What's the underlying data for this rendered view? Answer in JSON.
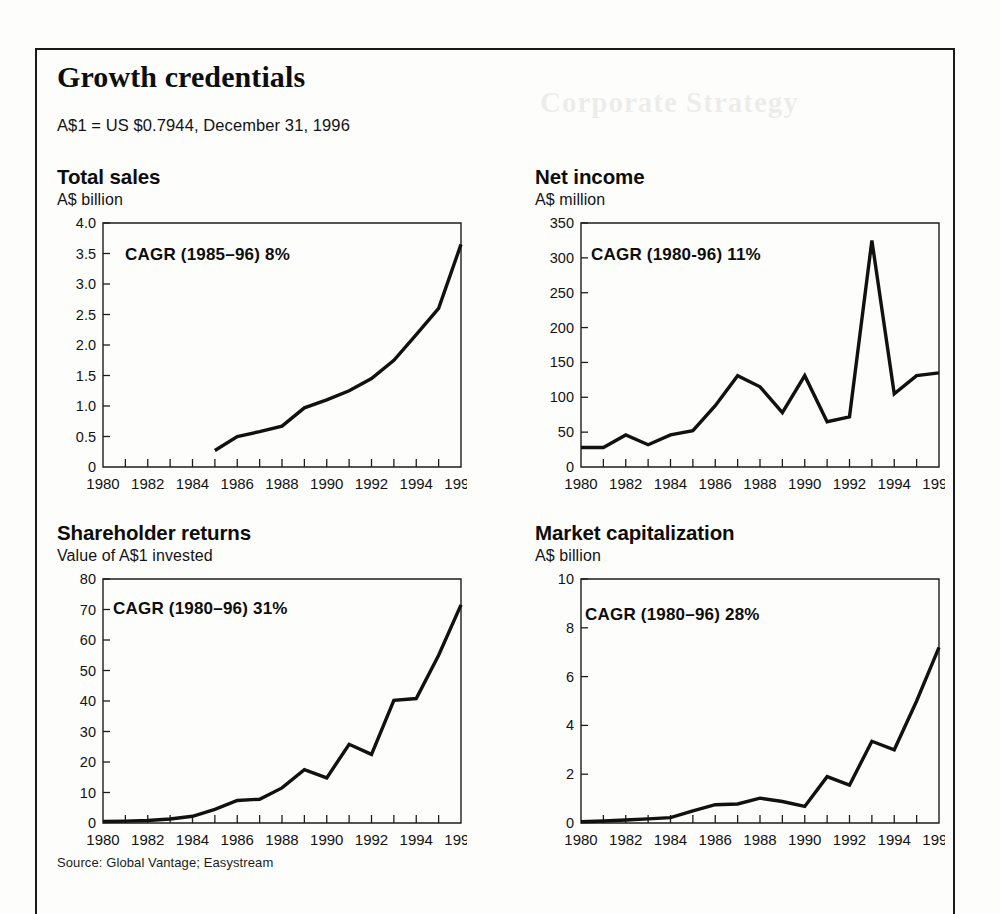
{
  "exhibit": {
    "title": "Growth credentials",
    "fx_note": "A$1 = US $0.7944, December 31, 1996",
    "source": "Source: Global Vantage; Easystream"
  },
  "bleed_through": {
    "title": "Corporate Strategy",
    "paragraph": "",
    "paragraph2": ""
  },
  "chart_data": [
    {
      "id": "total-sales",
      "type": "line",
      "title": "Total sales",
      "subtitle": "A$ billion",
      "annotation": "CAGR (1985–96) 8%",
      "xlabel": "",
      "ylabel": "A$ billion",
      "grid": false,
      "legend": "none",
      "xlim": [
        1980,
        1996
      ],
      "ylim": [
        0,
        4.0
      ],
      "xticks": [
        1980,
        1981,
        1982,
        1983,
        1984,
        1985,
        1986,
        1987,
        1988,
        1989,
        1990,
        1991,
        1992,
        1993,
        1994,
        1995,
        1996
      ],
      "xticklabels": [
        "1980",
        "",
        "1982",
        "",
        "1984",
        "",
        "1986",
        "",
        "1988",
        "",
        "1990",
        "",
        "1992",
        "",
        "1994",
        "",
        "1996"
      ],
      "yticks": [
        0,
        0.5,
        1.0,
        1.5,
        2.0,
        2.5,
        3.0,
        3.5,
        4.0
      ],
      "yticklabels": [
        "0",
        "0.5",
        "1.0",
        "1.5",
        "2.0",
        "2.5",
        "3.0",
        "3.5",
        "4.0"
      ],
      "x": [
        1985,
        1986,
        1987,
        1988,
        1989,
        1990,
        1991,
        1992,
        1993,
        1994,
        1995,
        1996
      ],
      "values": [
        0.27,
        0.5,
        0.58,
        0.67,
        0.97,
        1.1,
        1.25,
        1.45,
        1.75,
        2.17,
        2.6,
        3.65
      ]
    },
    {
      "id": "net-income",
      "type": "line",
      "title": "Net income",
      "subtitle": "A$ million",
      "annotation": "CAGR (1980-96) 11%",
      "xlabel": "",
      "ylabel": "A$ million",
      "grid": false,
      "legend": "none",
      "xlim": [
        1980,
        1996
      ],
      "ylim": [
        0,
        350
      ],
      "xticks": [
        1980,
        1981,
        1982,
        1983,
        1984,
        1985,
        1986,
        1987,
        1988,
        1989,
        1990,
        1991,
        1992,
        1993,
        1994,
        1995,
        1996
      ],
      "xticklabels": [
        "1980",
        "",
        "1982",
        "",
        "1984",
        "",
        "1986",
        "",
        "1988",
        "",
        "1990",
        "",
        "1992",
        "",
        "1994",
        "",
        "1996"
      ],
      "yticks": [
        0,
        50,
        100,
        150,
        200,
        250,
        300,
        350
      ],
      "yticklabels": [
        "0",
        "50",
        "100",
        "150",
        "200",
        "250",
        "300",
        "350"
      ],
      "x": [
        1980,
        1981,
        1982,
        1983,
        1984,
        1985,
        1986,
        1987,
        1988,
        1989,
        1990,
        1991,
        1992,
        1993,
        1994,
        1995,
        1996
      ],
      "values": [
        28,
        28,
        46,
        32,
        46,
        52,
        88,
        131,
        115,
        78,
        131,
        65,
        72,
        325,
        105,
        131,
        135
      ]
    },
    {
      "id": "shareholder-returns",
      "type": "line",
      "title": "Shareholder returns",
      "subtitle": "Value of A$1 invested",
      "annotation": "CAGR (1980–96) 31%",
      "xlabel": "",
      "ylabel": "Value of A$1 invested",
      "grid": false,
      "legend": "none",
      "xlim": [
        1980,
        1996
      ],
      "ylim": [
        0,
        80
      ],
      "xticks": [
        1980,
        1981,
        1982,
        1983,
        1984,
        1985,
        1986,
        1987,
        1988,
        1989,
        1990,
        1991,
        1992,
        1993,
        1994,
        1995,
        1996
      ],
      "xticklabels": [
        "1980",
        "",
        "1982",
        "",
        "1984",
        "",
        "1986",
        "",
        "1988",
        "",
        "1990",
        "",
        "1992",
        "",
        "1994",
        "",
        "1996"
      ],
      "yticks": [
        0,
        10,
        20,
        30,
        40,
        50,
        60,
        70,
        80
      ],
      "yticklabels": [
        "0",
        "10",
        "20",
        "30",
        "40",
        "50",
        "60",
        "70",
        "80"
      ],
      "x": [
        1980,
        1981,
        1982,
        1983,
        1984,
        1985,
        1986,
        1987,
        1988,
        1989,
        1990,
        1991,
        1992,
        1993,
        1994,
        1995,
        1996
      ],
      "values": [
        0.5,
        0.6,
        0.8,
        1.3,
        2.2,
        4.5,
        7.4,
        7.8,
        11.5,
        17.5,
        14.8,
        25.8,
        22.5,
        40.2,
        40.8,
        55,
        71.5
      ]
    },
    {
      "id": "market-capitalization",
      "type": "line",
      "title": "Market capitalization",
      "subtitle": "A$ billion",
      "annotation": "CAGR (1980–96) 28%",
      "xlabel": "",
      "ylabel": "A$ billion",
      "grid": false,
      "legend": "none",
      "xlim": [
        1980,
        1996
      ],
      "ylim": [
        0,
        10
      ],
      "xticks": [
        1980,
        1981,
        1982,
        1983,
        1984,
        1985,
        1986,
        1987,
        1988,
        1989,
        1990,
        1991,
        1992,
        1993,
        1994,
        1995,
        1996
      ],
      "xticklabels": [
        "1980",
        "",
        "1982",
        "",
        "1984",
        "",
        "1986",
        "",
        "1988",
        "",
        "1990",
        "",
        "1992",
        "",
        "1994",
        "",
        "1996"
      ],
      "yticks": [
        0,
        2,
        4,
        6,
        8,
        10
      ],
      "yticklabels": [
        "0",
        "2",
        "4",
        "6",
        "8",
        "10"
      ],
      "x": [
        1980,
        1981,
        1982,
        1983,
        1984,
        1985,
        1986,
        1987,
        1988,
        1989,
        1990,
        1991,
        1992,
        1993,
        1994,
        1995,
        1996
      ],
      "values": [
        0.05,
        0.08,
        0.12,
        0.17,
        0.22,
        0.5,
        0.75,
        0.78,
        1.02,
        0.88,
        0.68,
        1.9,
        1.55,
        3.35,
        3.0,
        5.0,
        7.2
      ]
    }
  ]
}
